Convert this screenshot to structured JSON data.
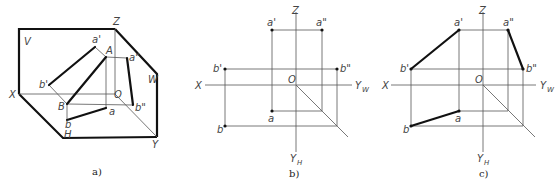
{
  "figure": {
    "panels": [
      {
        "id": "a",
        "caption": "a)",
        "description": "Pictorial (axonometric) view of line segment AB with projections onto V, H and W planes",
        "labels": {
          "plane_v": "V",
          "plane_w": "W",
          "plane_h": "H",
          "axis_x": "X",
          "axis_y": "Y",
          "axis_z": "Z",
          "origin": "O",
          "point_A": "A",
          "point_B": "B",
          "a_front": "a'",
          "b_front": "b'",
          "a_side": "a\"",
          "b_side": "b\"",
          "a_top": "a",
          "b_top": "b"
        }
      },
      {
        "id": "b",
        "caption": "b)",
        "description": "Orthographic projection of points A and B (points only)",
        "labels": {
          "axis_x": "X",
          "axis_z": "Z",
          "axis_yw": "Y",
          "axis_yw_sub": "W",
          "axis_yh": "Y",
          "axis_yh_sub": "H",
          "origin": "O",
          "a_front": "a'",
          "a_side": "a\"",
          "b_front": "b'",
          "b_side": "b\"",
          "a_top": "a",
          "b_top": "b"
        }
      },
      {
        "id": "c",
        "caption": "c)",
        "description": "Orthographic projection of line AB (projections connected)",
        "labels": {
          "axis_x": "X",
          "axis_z": "Z",
          "axis_yw": "Y",
          "axis_yw_sub": "W",
          "axis_yh": "Y",
          "axis_yh_sub": "H",
          "origin": "O",
          "a_front": "a'",
          "a_side": "a\"",
          "b_front": "b'",
          "b_side": "b\"",
          "a_top": "a",
          "b_top": "b"
        }
      }
    ]
  }
}
